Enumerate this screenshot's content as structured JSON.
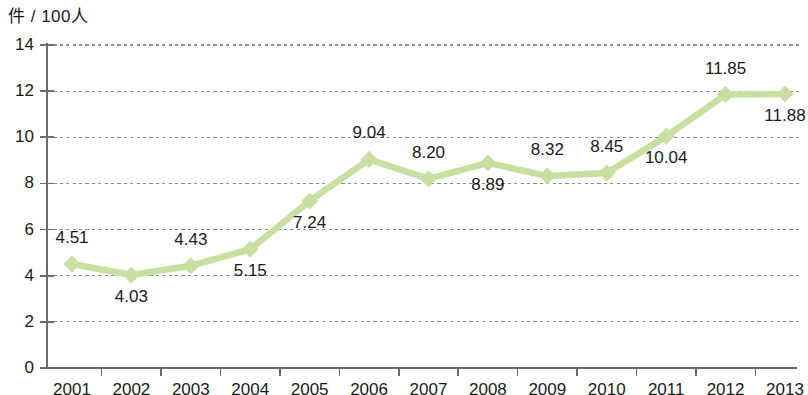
{
  "chart_data": {
    "type": "line",
    "title": "",
    "subtitle": "",
    "xlabel": "",
    "ylabel": "件 / 100人",
    "unit_label": "件 / 100人",
    "categories": [
      "2001",
      "2002",
      "2003",
      "2004",
      "2005",
      "2006",
      "2007",
      "2008",
      "2009",
      "2010",
      "2011",
      "2012",
      "2013"
    ],
    "values": [
      4.51,
      4.03,
      4.43,
      5.15,
      7.24,
      9.04,
      8.2,
      8.89,
      8.32,
      8.45,
      10.04,
      11.85,
      11.88
    ],
    "data_labels": [
      "4.51",
      "4.03",
      "4.43",
      "5.15",
      "7.24",
      "9.04",
      "8.20",
      "8.89",
      "8.32",
      "8.45",
      "10.04",
      "11.85",
      "11.88"
    ],
    "data_label_positions": [
      "above",
      "below",
      "above",
      "below",
      "below",
      "above",
      "above",
      "below",
      "above",
      "above",
      "below",
      "above",
      "below"
    ],
    "ylim": [
      0,
      14
    ],
    "ytick_step": 2,
    "ytick_labels": [
      "0",
      "2",
      "4",
      "6",
      "8",
      "10",
      "12",
      "14"
    ],
    "grid": true,
    "grid_axis": "y",
    "legend": false,
    "legend_position": "none",
    "marker": "diamond",
    "series": [
      {
        "name": "件 / 100人",
        "values": [
          4.51,
          4.03,
          4.43,
          5.15,
          7.24,
          9.04,
          8.2,
          8.89,
          8.32,
          8.45,
          10.04,
          11.85,
          11.88
        ]
      }
    ],
    "colors": {
      "line": "#c8dfa2",
      "marker": "#c8dfa2",
      "axis": "#6b6b6b",
      "grid": "#8a8a8a",
      "text": "#1a1a1a"
    }
  }
}
